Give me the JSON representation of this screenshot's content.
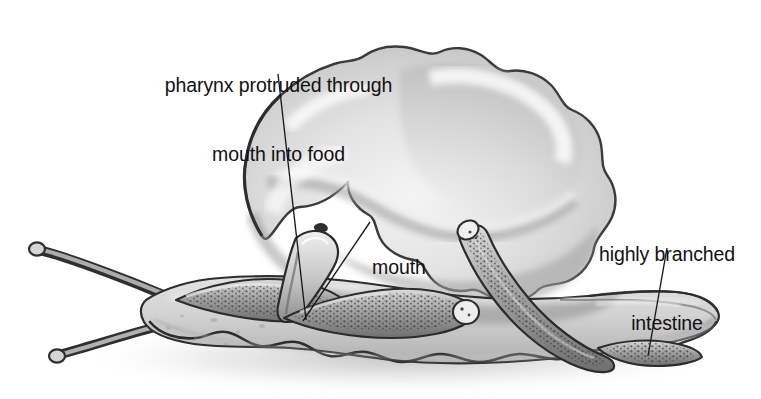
{
  "figure": {
    "type": "biological-illustration",
    "style": "grayscale pencil rendering",
    "background_color": "#ffffff",
    "width": 761,
    "height": 399
  },
  "labels": {
    "pharynx": {
      "line1": "pharynx protruded through",
      "line2": "mouth into food",
      "leader": {
        "x1": 278,
        "y1": 74,
        "x2": 306,
        "y2": 320
      }
    },
    "mouth": {
      "line1": "mouth",
      "leader": {
        "x1": 370,
        "y1": 222,
        "x2": 303,
        "y2": 321
      }
    },
    "intestine": {
      "line1": "highly branched",
      "line2": "intestine",
      "leader": {
        "x1": 667,
        "y1": 248,
        "x2": 648,
        "y2": 356
      }
    }
  },
  "colors": {
    "text": "#111111",
    "leader_line": "#1a1a1a",
    "outline_dark": "#2b2b2b",
    "food_mid": "#c8c8c8",
    "food_light": "#ececec",
    "food_highlight": "#f7f7f7",
    "food_shadow": "#9a9a9a",
    "body_light": "#d9d9d9",
    "body_mid": "#bdbdbd",
    "body_shadow": "#8a8a8a",
    "gut_dark": "#565656",
    "gut_speckle": "#3a3a3a",
    "ground_shadow": "#bfbfbf"
  },
  "anatomy": {
    "parts": [
      {
        "name": "food-mass",
        "description": "large irregular lobed grey blob occupying upper center-right"
      },
      {
        "name": "worm-body",
        "description": "flattened ruffled-margin flatworm body spanning lower width"
      },
      {
        "name": "head-tentacles",
        "description": "two slender auricles projecting to the left"
      },
      {
        "name": "pharynx",
        "description": "tubular pharynx protruded from mouth into the food mass"
      },
      {
        "name": "intestine-branch-left",
        "description": "speckled diverticulum running up-left"
      },
      {
        "name": "intestine-branch-right",
        "description": "speckled diverticulum running up-right"
      },
      {
        "name": "intestine-branch-tail",
        "description": "speckled diverticulum running to the tail at right"
      }
    ]
  }
}
